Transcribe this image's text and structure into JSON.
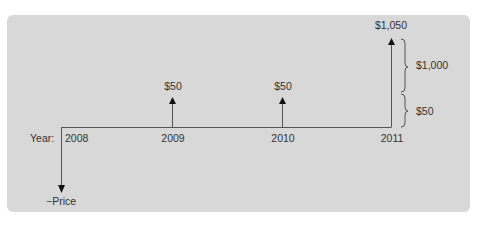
{
  "diagram": {
    "type": "cash-flow-timeline",
    "axis_label": "Year:",
    "years": [
      {
        "label": "2008",
        "x": 72
      },
      {
        "label": "2009",
        "x": 172
      },
      {
        "label": "2010",
        "x": 282
      },
      {
        "label": "2011",
        "x": 391
      }
    ],
    "outflow": {
      "year": "2008",
      "label": "−Price",
      "direction": "down"
    },
    "inflows": [
      {
        "year": "2009",
        "label": "$50"
      },
      {
        "year": "2010",
        "label": "$50"
      },
      {
        "year": "2011",
        "label": "$1,050"
      }
    ],
    "braces": [
      {
        "label": "$1,000",
        "meaning": "principal"
      },
      {
        "label": "$50",
        "meaning": "coupon"
      }
    ],
    "colors": {
      "panel_background": "#d8d8d8",
      "line": "#555555",
      "text": "#333333",
      "page_background": "#ffffff"
    }
  }
}
